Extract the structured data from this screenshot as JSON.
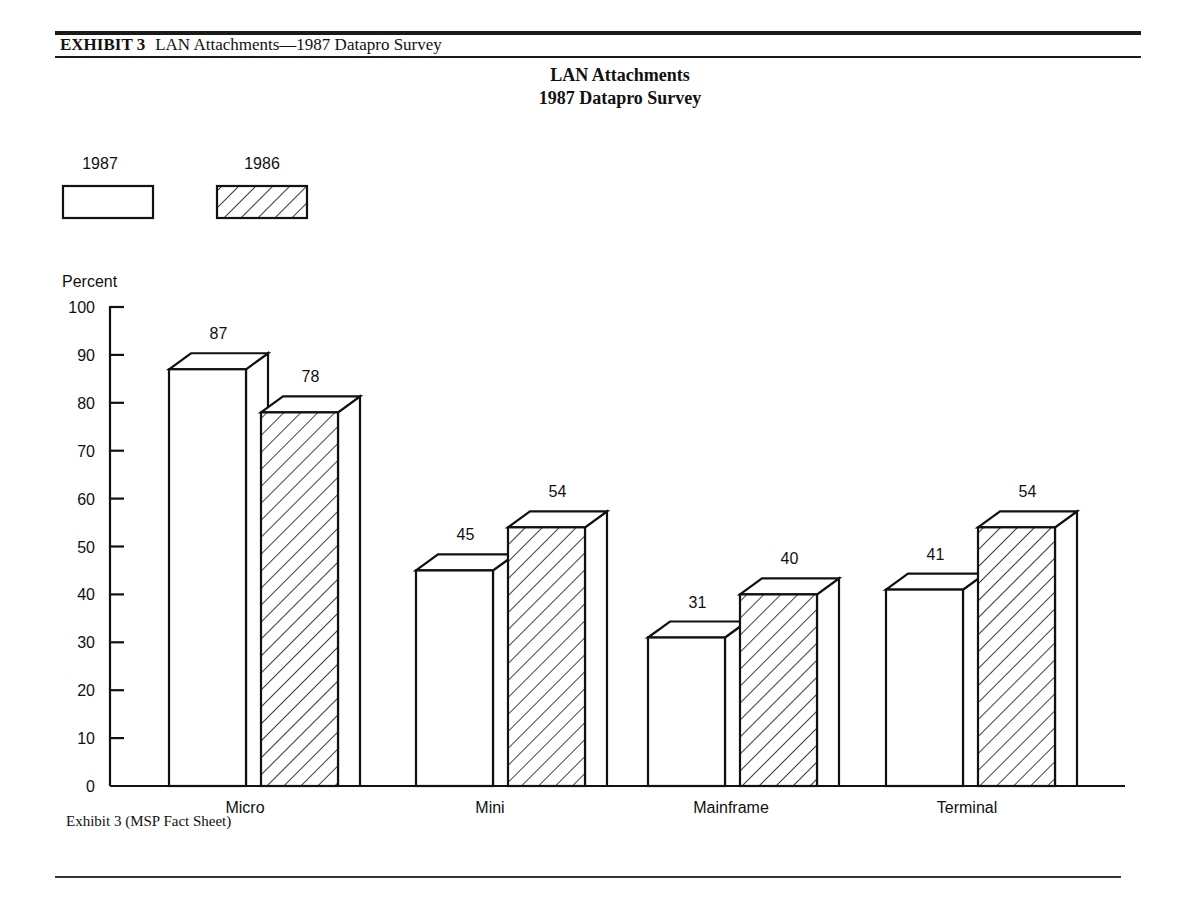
{
  "exhibit": {
    "number_label": "EXHIBIT 3",
    "heading": "LAN Attachments—1987 Datapro Survey",
    "footnote": "Exhibit 3 (MSP Fact Sheet)"
  },
  "chart_data": {
    "type": "bar",
    "title": "LAN Attachments",
    "subtitle": "1987 Datapro Survey",
    "xlabel": "",
    "ylabel": "Percent",
    "ylim": [
      0,
      100
    ],
    "yticks": [
      0,
      10,
      20,
      30,
      40,
      50,
      60,
      70,
      80,
      90,
      100
    ],
    "grid": false,
    "legend_position": "top-left",
    "style": "3d-bars",
    "categories": [
      "Micro",
      "Mini",
      "Mainframe",
      "Terminal"
    ],
    "series": [
      {
        "name": "1987",
        "fill": "plain",
        "values": [
          87,
          45,
          31,
          41
        ]
      },
      {
        "name": "1986",
        "fill": "hatched",
        "values": [
          78,
          54,
          40,
          54
        ]
      }
    ]
  }
}
